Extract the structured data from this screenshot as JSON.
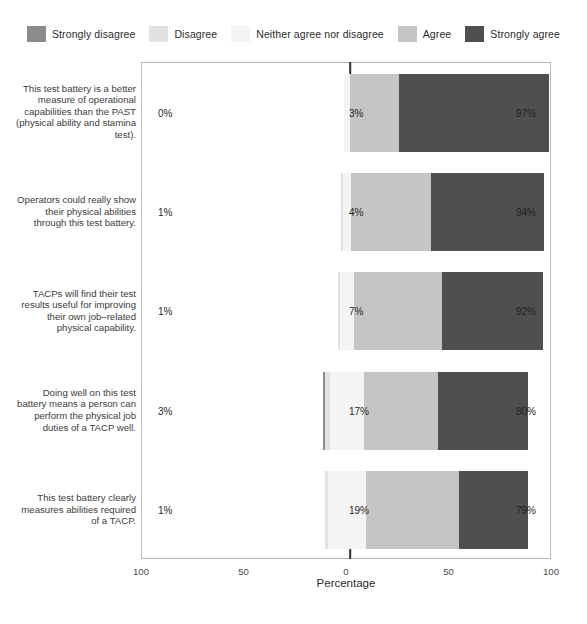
{
  "chart_data": {
    "type": "bar",
    "subtype": "diverging-stacked-likert",
    "title": "",
    "xlabel": "Percentage",
    "ylabel": "",
    "xlim": [
      -100,
      100
    ],
    "xticks": [
      "100",
      "50",
      "0",
      "50",
      "100"
    ],
    "xtick_values": [
      -100,
      -50,
      0,
      50,
      100
    ],
    "grid": false,
    "legend_position": "top",
    "legend": [
      "Strongly disagree",
      "Disagree",
      "Neither agree nor disagree",
      "Agree",
      "Strongly agree"
    ],
    "colors": {
      "strongly_disagree": "#8c8c8c",
      "disagree": "#e2e2e2",
      "neither": "#f4f4f4",
      "agree": "#c5c5c5",
      "strongly_agree": "#4f4f4f",
      "panel_border": "#b9b9b9",
      "zero_line": "#2f2f2f",
      "text": "#3a3a3a"
    },
    "categories": [
      "This test battery is a better measure of operational capabilities than the PAST (physical ability and stamina test).",
      "Operators could really show their physical abilities through this test battery.",
      "TACPs will find their test results useful for improving their own job-related physical capability.",
      "Doing well on this test battery means a person can perform the physical job duties of a TACP well.",
      "This test battery clearly measures abilities required of a TACP."
    ],
    "series": [
      {
        "name": "Strongly disagree",
        "values": [
          0,
          0,
          0,
          1,
          0
        ]
      },
      {
        "name": "Disagree",
        "values": [
          0,
          1,
          1,
          2,
          1
        ]
      },
      {
        "name": "Neither agree nor disagree",
        "values": [
          3,
          4,
          7,
          17,
          19
        ]
      },
      {
        "name": "Agree",
        "values": [
          24,
          39,
          43,
          36,
          45
        ]
      },
      {
        "name": "Strongly agree",
        "values": [
          73,
          55,
          49,
          44,
          34
        ]
      }
    ],
    "rows": [
      {
        "label_lines": [
          "This test battery is a better",
          "measure of operational",
          "capabilities than the PAST",
          "(physical ability and stamina",
          "test)."
        ],
        "disagree_label": "0%",
        "neutral_label": "3%",
        "agree_label": "97%",
        "strongly_disagree": 0,
        "disagree": 0,
        "neither": 3,
        "agree": 24,
        "strongly_agree": 73
      },
      {
        "label_lines": [
          "Operators could really show",
          "their physical abilities",
          "through this test battery."
        ],
        "disagree_label": "1%",
        "neutral_label": "4%",
        "agree_label": "94%",
        "strongly_disagree": 0,
        "disagree": 1,
        "neither": 4,
        "agree": 39,
        "strongly_agree": 55
      },
      {
        "label_lines": [
          "TACPs will find their test",
          "results useful for improving",
          "their own job–related",
          "physical capability."
        ],
        "disagree_label": "1%",
        "neutral_label": "7%",
        "agree_label": "92%",
        "strongly_disagree": 0,
        "disagree": 1,
        "neither": 7,
        "agree": 43,
        "strongly_agree": 49
      },
      {
        "label_lines": [
          "Doing well on this test",
          "battery means a person can",
          "perform the physical job",
          "duties of a TACP well."
        ],
        "disagree_label": "3%",
        "neutral_label": "17%",
        "agree_label": "80%",
        "strongly_disagree": 1,
        "disagree": 2,
        "neither": 17,
        "agree": 36,
        "strongly_agree": 44
      },
      {
        "label_lines": [
          "This test battery clearly",
          "measures abilities required",
          "of a TACP."
        ],
        "disagree_label": "1%",
        "neutral_label": "19%",
        "agree_label": "79%",
        "strongly_disagree": 0,
        "disagree": 1,
        "neither": 19,
        "agree": 45,
        "strongly_agree": 34
      }
    ]
  }
}
